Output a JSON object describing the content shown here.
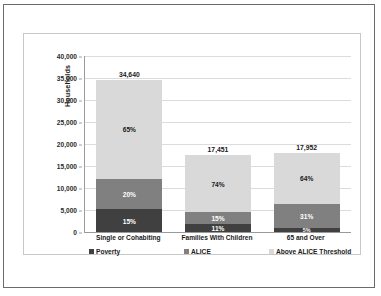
{
  "chart_data": {
    "type": "bar",
    "subtype": "stacked-bar-percent",
    "title": "",
    "xlabel": "",
    "ylabel": "Households",
    "ylim": [
      0,
      40000
    ],
    "ytick_step": 5000,
    "ytick_labels": [
      "0",
      "5,000",
      "10,000",
      "15,000",
      "20,000",
      "25,000",
      "30,000",
      "35,000",
      "40,000"
    ],
    "ytick_values": [
      0,
      5000,
      10000,
      15000,
      20000,
      25000,
      30000,
      35000,
      40000
    ],
    "grid": true,
    "legend_position": "bottom",
    "categories": [
      "Single or Cohabiting",
      "Families With Children",
      "65 and Over"
    ],
    "totals": [
      34640,
      17451,
      17952
    ],
    "total_labels": [
      "34,640",
      "17,451",
      "17,952"
    ],
    "series": [
      {
        "name": "Poverty",
        "color": "#404040",
        "values": [
          5196,
          1920,
          898
        ],
        "percents": [
          15,
          11,
          5
        ],
        "percent_labels": [
          "15%",
          "11%",
          "5%"
        ]
      },
      {
        "name": "ALICE",
        "color": "#808080",
        "values": [
          6928,
          2618,
          5565
        ],
        "percents": [
          20,
          15,
          31
        ],
        "percent_labels": [
          "20%",
          "15%",
          "31%"
        ]
      },
      {
        "name": "Above ALICE Threshold",
        "color": "#d9d9d9",
        "values": [
          22516,
          12914,
          11489
        ],
        "percents": [
          65,
          74,
          64
        ],
        "percent_labels": [
          "65%",
          "74%",
          "64%"
        ]
      }
    ]
  },
  "legend": {
    "items": [
      {
        "label": "Poverty",
        "color": "#404040",
        "marker": "square-marker"
      },
      {
        "label": "ALICE",
        "color": "#808080",
        "marker": "square-marker"
      },
      {
        "label": "Above ALICE Threshold",
        "color": "#d9d9d9",
        "marker": "square-marker"
      }
    ]
  }
}
